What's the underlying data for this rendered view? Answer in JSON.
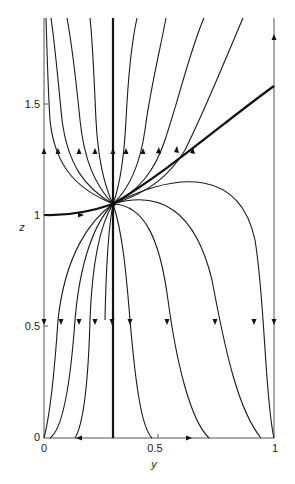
{
  "figure": {
    "type": "phase-portrait",
    "xlabel": "y",
    "ylabel": "z",
    "x_ticks": [
      {
        "value": 0,
        "label": "0"
      },
      {
        "value": 0.5,
        "label": "0.5"
      },
      {
        "value": 1,
        "label": "1"
      }
    ],
    "y_ticks": [
      {
        "value": 0,
        "label": "0"
      },
      {
        "value": 0.5,
        "label": "0.5"
      },
      {
        "value": 1,
        "label": "1"
      },
      {
        "value": 1.5,
        "label": "1.5"
      }
    ],
    "xlim": [
      0,
      1
    ],
    "ylim": [
      0,
      1.9
    ],
    "node": {
      "y": 0.3,
      "z": 1.05,
      "kind": "stable-unstable node (saddle-node style convergence)"
    },
    "invariant_lines": [
      {
        "name": "left-boundary",
        "y": 0,
        "direction": "up above z=1.05 region / down below"
      },
      {
        "name": "vertical-separatrix",
        "y": 0.3,
        "heavy": true
      },
      {
        "name": "right-boundary",
        "y": 1,
        "direction_top": "up",
        "direction_bottom": "down"
      },
      {
        "name": "bottom-axis",
        "z": 0,
        "arrows": [
          "left near y=0.2",
          "right near y=0.6"
        ]
      }
    ],
    "heavy_separatrix": [
      {
        "from": [
          0,
          1.0
        ],
        "to": [
          0.3,
          1.05
        ]
      },
      {
        "from": [
          0.3,
          1.05
        ],
        "to": [
          1,
          1.6
        ]
      }
    ]
  }
}
